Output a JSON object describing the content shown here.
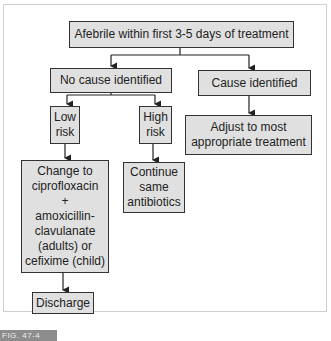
{
  "flowchart": {
    "root": "Afebrile within first 3-5 days of treatment",
    "left_branch": "No cause identified",
    "right_branch": "Cause identified",
    "low_risk": "Low\nrisk",
    "high_risk": "High\nrisk",
    "right_action": "Adjust to most\nappropriate treatment",
    "low_action": "Change to\nciprofloxacin\n+\namoxicillin-\nclavulanate\n(adults) or\ncefixime (child)",
    "high_action": "Continue\nsame\nantibiotics",
    "final": "Discharge"
  },
  "caption": "FIG. 47-4",
  "colors": {
    "box_fill": "#e0e0e0",
    "border": "#333333",
    "caption_bg": "#8c8c8c"
  }
}
